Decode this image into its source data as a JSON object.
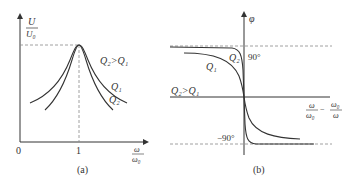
{
  "figure_a": {
    "y_axis_label_num": "U",
    "y_axis_label_den": "U₀",
    "x_axis_label_num": "ω",
    "x_axis_label_den": "ω₀",
    "origin_label": "0",
    "x_tick_label": "1",
    "relation_label": "Q₂>Q₁",
    "curve_q1_label": "Q₁",
    "curve_q2_label": "Q₂",
    "caption": "(a)"
  },
  "figure_b": {
    "y_axis_label": "φ",
    "x_axis_label_1_num": "ω",
    "x_axis_label_1_den": "ω₀",
    "x_axis_minus": "−",
    "x_axis_label_2_num": "ω₀",
    "x_axis_label_2_den": "ω",
    "upper_asymptote_label": "90°",
    "lower_asymptote_label": "−90°",
    "relation_label": "Q₂>Q₁",
    "curve_q1_label": "Q₁",
    "curve_q2_label": "Q₂",
    "caption": "(b)"
  },
  "colors": {
    "line": "#333333",
    "dashed": "#888888"
  }
}
